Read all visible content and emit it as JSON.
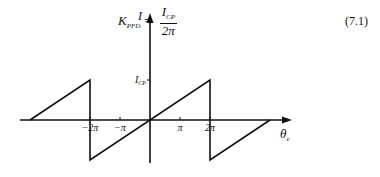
{
  "equation": {
    "lhs_symbol": "K",
    "lhs_subscript": "PFD",
    "equals": "=",
    "numerator_symbol": "I",
    "numerator_subscript": "CP",
    "denominator": "2π",
    "number": "(7.1)"
  },
  "chart_data": {
    "type": "line",
    "title": "",
    "xlabel": "θ_e",
    "ylabel": "I",
    "x_ticks": [
      {
        "value": -2,
        "label": "−2π"
      },
      {
        "value": -1,
        "label": "−π"
      },
      {
        "value": 1,
        "label": "π"
      },
      {
        "value": 2,
        "label": "2π"
      }
    ],
    "y_ticks": [
      {
        "value": 1,
        "label": "I_CP"
      }
    ],
    "x_units": "π",
    "xlim": [
      -4,
      4.5
    ],
    "ylim": [
      -1.3,
      2
    ],
    "series": [
      {
        "name": "PFD sawtooth",
        "points": [
          [
            -4,
            0
          ],
          [
            -2,
            1
          ],
          [
            -2,
            -1
          ],
          [
            2,
            1
          ],
          [
            2,
            -1
          ],
          [
            4,
            0
          ]
        ]
      }
    ]
  }
}
